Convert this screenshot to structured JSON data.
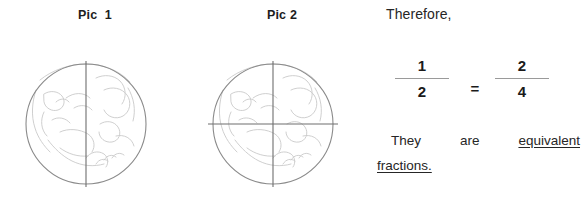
{
  "pictures": [
    {
      "label": "Pic  1",
      "parts": 2,
      "divider": "vertical",
      "name": "pic-1"
    },
    {
      "label": "Pic 2",
      "parts": 4,
      "divider": "vertical-and-horizontal",
      "name": "pic-2"
    }
  ],
  "text": {
    "therefore": "Therefore,",
    "conclusion_words": {
      "they": "They",
      "are": "are",
      "equivalent": "equivalent",
      "fractions": "fractions."
    }
  },
  "equation": {
    "left_fraction": {
      "numerator": "1",
      "denominator": "2"
    },
    "operator": "=",
    "right_fraction": {
      "numerator": "2",
      "denominator": "4"
    }
  },
  "colors": {
    "background": "#ffffff",
    "text": "#262626",
    "circle_outline": "#8a8a8a",
    "circle_texture": "#c9c9c9",
    "divider_line": "#6e6e6e",
    "fraction_bar": "#9a9a9a"
  }
}
